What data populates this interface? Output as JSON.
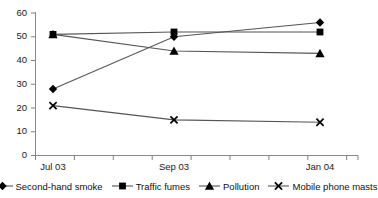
{
  "chart_data": {
    "type": "line",
    "title": "",
    "subtitle": "",
    "xlabel": "",
    "ylabel": "",
    "grid": false,
    "legend_position": "bottom",
    "ylim": [
      0,
      60
    ],
    "yticks": [
      0,
      10,
      20,
      30,
      40,
      50,
      60
    ],
    "ytick_labels": [
      "0",
      "10",
      "20",
      "30",
      "40",
      "50",
      "60"
    ],
    "categories": [
      "Jul 03",
      "Sep 03",
      "Jan 04"
    ],
    "xtick_labels": [
      "Jul 03",
      "Sep 03",
      "Jan 04"
    ],
    "series": [
      {
        "name": "Second-hand smoke",
        "marker": "diamond",
        "values": [
          28,
          50,
          56
        ]
      },
      {
        "name": "Traffic fumes",
        "marker": "square",
        "values": [
          51,
          52,
          52
        ]
      },
      {
        "name": "Pollution",
        "marker": "triangle",
        "values": [
          51,
          44,
          43
        ]
      },
      {
        "name": "Mobile phone masts",
        "marker": "cross",
        "values": [
          21,
          15,
          14
        ]
      }
    ],
    "colors": {
      "line": "#555555",
      "marker": "#000000",
      "axis": "#808080",
      "text": "#111111",
      "background": "#ffffff"
    }
  },
  "legend": {
    "items": [
      {
        "label": "Second-hand smoke",
        "marker": "diamond-marker-icon"
      },
      {
        "label": "Traffic fumes",
        "marker": "square-marker-icon"
      },
      {
        "label": "Pollution",
        "marker": "triangle-marker-icon"
      },
      {
        "label": "Mobile phone masts",
        "marker": "cross-marker-icon"
      }
    ]
  },
  "axes": {
    "y_labels": [
      "60",
      "50",
      "40",
      "30",
      "20",
      "10",
      "0"
    ],
    "x_labels": [
      "Jul 03",
      "Sep 03",
      "Jan 04"
    ]
  }
}
